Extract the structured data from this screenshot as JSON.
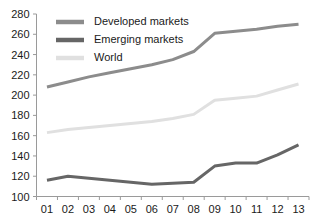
{
  "chart_data": {
    "type": "line",
    "title": "",
    "xlabel": "",
    "ylabel": "",
    "x": [
      "01",
      "02",
      "03",
      "04",
      "05",
      "06",
      "07",
      "08",
      "09",
      "10",
      "11",
      "12",
      "13"
    ],
    "categories": [
      "01",
      "02",
      "03",
      "04",
      "05",
      "06",
      "07",
      "08",
      "09",
      "10",
      "11",
      "12",
      "13"
    ],
    "ylim": [
      100,
      280
    ],
    "y_ticks": [
      100,
      120,
      140,
      160,
      180,
      200,
      220,
      240,
      260,
      280
    ],
    "y_tick_labels": [
      "100",
      "120",
      "140",
      "160",
      "180",
      "200",
      "220",
      "240",
      "260",
      "280"
    ],
    "x_tick_labels": [
      "01",
      "02",
      "03",
      "04",
      "05",
      "06",
      "07",
      "08",
      "09",
      "10",
      "11",
      "12",
      "13"
    ],
    "grid": false,
    "legend_position": "top-left",
    "series": [
      {
        "name": "Developed markets",
        "color": "#8c8c8c",
        "values": [
          208,
          213,
          218,
          222,
          226,
          230,
          235,
          243,
          261,
          263,
          265,
          268,
          270
        ]
      },
      {
        "name": "Emerging markets",
        "color": "#666666",
        "values": [
          116,
          120,
          118,
          116,
          114,
          112,
          113,
          114,
          130,
          133,
          133,
          141,
          151
        ]
      },
      {
        "name": "World",
        "color": "#e0e0e0",
        "values": [
          163,
          166,
          168,
          170,
          172,
          174,
          177,
          181,
          195,
          197,
          199,
          205,
          211
        ]
      }
    ],
    "legend": [
      {
        "label": "Developed markets",
        "color": "#8c8c8c"
      },
      {
        "label": "Emerging markets",
        "color": "#666666"
      },
      {
        "label": "World",
        "color": "#e0e0e0"
      }
    ]
  }
}
